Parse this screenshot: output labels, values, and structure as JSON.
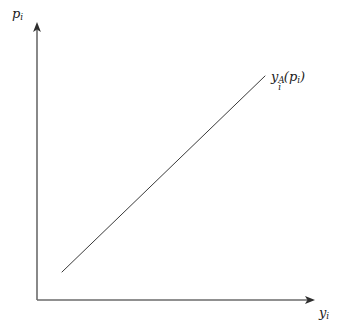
{
  "figure": {
    "background_color": "#ffffff",
    "line_color": "#3a3a3a",
    "axis_color": "#6b6b6b",
    "text_color": "#1a1a1a",
    "width": 343,
    "height": 330
  },
  "axes": {
    "y_axis": {
      "label_base": "p",
      "label_sub": "i",
      "label_full": "p_i",
      "x": 37,
      "y_bottom": 300,
      "y_top": 22,
      "arrow": "up-arrow"
    },
    "x_axis": {
      "label_base": "y",
      "label_sub": "i",
      "label_full": "y_i",
      "y": 300,
      "x_left": 37,
      "x_right": 315,
      "arrow": "right-arrow"
    }
  },
  "curve": {
    "label_base": "y",
    "label_sub": "i",
    "label_sup": "A",
    "label_open_paren": "(",
    "label_arg_base": "p",
    "label_arg_sub": "i",
    "label_close_paren": ")",
    "label_full": "y_i^A(p_i)"
  },
  "chart_data": {
    "type": "line",
    "title": "",
    "xlabel": "y_i",
    "ylabel": "p_i",
    "grid": false,
    "legend": "none",
    "annotations": [
      {
        "text": "y_i^A(p_i)",
        "x_px": 271,
        "y_px": 70,
        "description": "label for the upward-sloping supply curve of agent i"
      }
    ],
    "axis_style": "arrow-headed, unlabeled ticks, origin at lower-left",
    "xlim_px": [
      37,
      315
    ],
    "ylim_px": [
      300,
      22
    ],
    "series": [
      {
        "name": "y_i^A(p_i)",
        "kind": "straight-line",
        "description": "linear upward-sloping supply function, drawn as a single straight segment that does not touch either axis",
        "points_px": [
          {
            "x": 62,
            "y": 272
          },
          {
            "x": 265,
            "y": 76
          }
        ],
        "normalized_points": [
          {
            "x": 0.09,
            "y": 0.1
          },
          {
            "x": 0.82,
            "y": 0.81
          }
        ],
        "slope_px": -0.966,
        "color": "#3a3a3a",
        "linewidth": 1
      }
    ]
  }
}
